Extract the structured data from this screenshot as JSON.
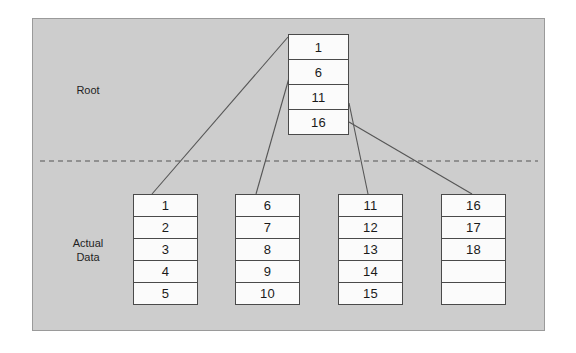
{
  "diagram": {
    "type": "tree",
    "labels": {
      "root": "Root",
      "actual_data": "Actual\nData"
    },
    "colors": {
      "panel_background": "#cdcdcd",
      "panel_border": "#9a9a9a",
      "cell_background": "#fbfbfb",
      "cell_border": "#4a4a4a",
      "connector": "#555555",
      "separator": "#555555",
      "text": "#1a1a1a",
      "page_background": "#ffffff"
    },
    "root_node": {
      "name": "root-node",
      "cells": [
        "1",
        "6",
        "11",
        "16"
      ]
    },
    "leaf_nodes": [
      {
        "name": "leaf-node-0",
        "cells": [
          "1",
          "2",
          "3",
          "4",
          "5"
        ]
      },
      {
        "name": "leaf-node-1",
        "cells": [
          "6",
          "7",
          "8",
          "9",
          "10"
        ]
      },
      {
        "name": "leaf-node-2",
        "cells": [
          "11",
          "12",
          "13",
          "14",
          "15"
        ]
      },
      {
        "name": "leaf-node-3",
        "cells": [
          "16",
          "17",
          "18",
          "",
          ""
        ]
      }
    ],
    "separator": {
      "name": "level-separator",
      "style": "dashed",
      "y": 161
    },
    "connectors": [
      {
        "name": "connector-root-to-leaf-0",
        "from": "root cell 1",
        "to": "leaf-node-0",
        "x1": 288,
        "y1": 37,
        "x2": 152,
        "y2": 194
      },
      {
        "name": "connector-root-to-leaf-1",
        "from": "root cell 6",
        "to": "leaf-node-1",
        "x1": 289,
        "y1": 78,
        "x2": 256,
        "y2": 194
      },
      {
        "name": "connector-root-to-leaf-2",
        "from": "root cell 11",
        "to": "leaf-node-2",
        "x1": 349,
        "y1": 103,
        "x2": 368,
        "y2": 194
      },
      {
        "name": "connector-root-to-leaf-3",
        "from": "root cell 16",
        "to": "leaf-node-3",
        "x1": 349,
        "y1": 122,
        "x2": 472,
        "y2": 194
      }
    ]
  }
}
